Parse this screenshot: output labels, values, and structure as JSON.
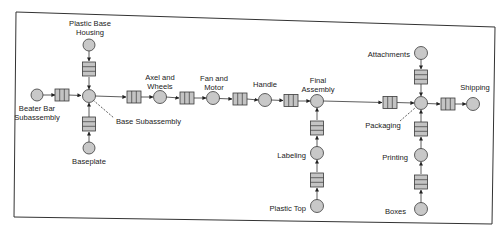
{
  "diagram": {
    "type": "process-flow",
    "colors": {
      "node_fill": "#c8c8c8",
      "queue_fill": "#c4c4c4",
      "stroke": "#3a3a3a",
      "frame": "#333333"
    },
    "nodes": [
      {
        "id": "beater",
        "label": "Beater Bar Subassembly",
        "line1": "Beater Bar",
        "line2": "Subassembly"
      },
      {
        "id": "plastic_base",
        "label": "Plastic Base Housing",
        "line1": "Plastic Base",
        "line2": "Housing"
      },
      {
        "id": "baseplate",
        "label": "Baseplate"
      },
      {
        "id": "base_sub",
        "label": "Base Subassembly"
      },
      {
        "id": "axel",
        "label": "Axel and Wheels",
        "line1": "Axel and",
        "line2": "Wheels"
      },
      {
        "id": "fan",
        "label": "Fan and Motor",
        "line1": "Fan and",
        "line2": "Motor"
      },
      {
        "id": "handle",
        "label": "Handle"
      },
      {
        "id": "final",
        "label": "Final Assembly",
        "line1": "Final",
        "line2": "Assembly"
      },
      {
        "id": "labeling",
        "label": "Labeling"
      },
      {
        "id": "plastic_top",
        "label": "Plastic Top"
      },
      {
        "id": "attachments",
        "label": "Attachments"
      },
      {
        "id": "packaging",
        "label": "Packaging"
      },
      {
        "id": "printing",
        "label": "Printing"
      },
      {
        "id": "boxes",
        "label": "Boxes"
      },
      {
        "id": "shipping",
        "label": "Shipping"
      }
    ],
    "edges": [
      [
        "beater",
        "base_sub"
      ],
      [
        "plastic_base",
        "base_sub"
      ],
      [
        "baseplate",
        "base_sub"
      ],
      [
        "base_sub",
        "axel"
      ],
      [
        "axel",
        "fan"
      ],
      [
        "fan",
        "handle"
      ],
      [
        "handle",
        "final"
      ],
      [
        "plastic_top",
        "labeling"
      ],
      [
        "labeling",
        "final"
      ],
      [
        "final",
        "packaging"
      ],
      [
        "attachments",
        "packaging"
      ],
      [
        "boxes",
        "printing"
      ],
      [
        "printing",
        "packaging"
      ],
      [
        "packaging",
        "shipping"
      ]
    ]
  }
}
